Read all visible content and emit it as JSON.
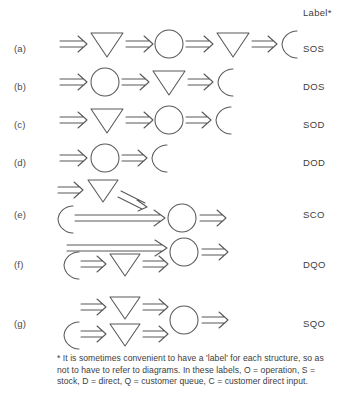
{
  "header": {
    "label_column_title": "Label*"
  },
  "rows": [
    {
      "id": "a",
      "marker": "(a)",
      "label": "SOS",
      "sequence": [
        "arrow",
        "triangle",
        "arrow",
        "circle",
        "arrow",
        "triangle",
        "arrow",
        "c-shape"
      ],
      "layout": "linear"
    },
    {
      "id": "b",
      "marker": "(b)",
      "label": "DOS",
      "sequence": [
        "arrow",
        "circle",
        "arrow",
        "triangle",
        "arrow",
        "c-shape"
      ],
      "layout": "linear"
    },
    {
      "id": "c",
      "marker": "(c)",
      "label": "SOD",
      "sequence": [
        "arrow",
        "triangle",
        "arrow",
        "circle",
        "arrow",
        "c-shape"
      ],
      "layout": "linear"
    },
    {
      "id": "d",
      "marker": "(d)",
      "label": "DOD",
      "sequence": [
        "arrow",
        "circle",
        "arrow",
        "c-shape"
      ],
      "layout": "linear"
    },
    {
      "id": "e",
      "marker": "(e)",
      "label": "SCO",
      "layout": "branched",
      "top_branch": [
        "arrow",
        "triangle",
        "arrow"
      ],
      "bottom_branch": [
        "c-shape",
        "long-arrow"
      ],
      "merge": [
        "circle",
        "arrow"
      ]
    },
    {
      "id": "f",
      "marker": "(f)",
      "label": "DQO",
      "layout": "branched",
      "top_branch": [
        "long-arrow"
      ],
      "bottom_branch": [
        "c-shape",
        "arrow",
        "triangle",
        "arrow"
      ],
      "merge": [
        "circle",
        "arrow"
      ]
    },
    {
      "id": "g",
      "marker": "(g)",
      "label": "SQO",
      "layout": "branched",
      "top_branch": [
        "arrow",
        "triangle",
        "arrow"
      ],
      "bottom_branch": [
        "c-shape",
        "arrow",
        "triangle",
        "arrow"
      ],
      "merge": [
        "circle",
        "arrow"
      ]
    }
  ],
  "footnote": {
    "text": "* It is sometimes convenient to have a 'label' for each structure, so as not to have to refer to diagrams. In these labels, O = operation, S = stock, D = direct, Q = customer queue, C = customer direct input."
  },
  "legend_meanings": {
    "O": "operation",
    "S": "stock",
    "D": "direct",
    "Q": "customer queue",
    "C": "customer direct input"
  },
  "colors": {
    "stroke": "#58585a",
    "text": "#3d3d3d",
    "background": "#ffffff"
  }
}
